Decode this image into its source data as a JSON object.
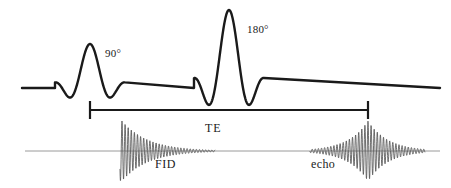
{
  "figure": {
    "kind": "spin-echo-pulse-sequence",
    "background_color": "#ffffff",
    "width": 451,
    "height": 188
  },
  "labels": {
    "pulse_90": "90°",
    "pulse_180": "180°",
    "te": "TE",
    "fid": "FID",
    "echo": "echo"
  },
  "colors": {
    "rf_line": "#1a1a1a",
    "bracket": "#1a1a1a",
    "signal_baseline": "#9a9a9a",
    "signal_trace": "#555555",
    "text": "#1a1a1a"
  },
  "chart_data": {
    "type": "line",
    "title": "",
    "xlabel": "",
    "ylabel": "",
    "grid": false,
    "legend": "none",
    "axes": [
      {
        "name": "rf-channel",
        "baseline_y": 88,
        "x_start": 22,
        "x_end": 440,
        "stroke_width": 2.4
      },
      {
        "name": "signal-channel",
        "baseline_y": 151,
        "x_start": 25,
        "x_end": 440,
        "stroke_width": 1.0
      }
    ],
    "pulses": [
      {
        "name": "rf-pulse-90",
        "label": "90°",
        "flip_angle_deg": 90,
        "center_x": 90,
        "half_width": 35,
        "peak_amplitude": 44,
        "shape": "sinc",
        "lobes": 2
      },
      {
        "name": "rf-pulse-180",
        "label": "180°",
        "flip_angle_deg": 180,
        "center_x": 229,
        "half_width": 35,
        "peak_amplitude": 78,
        "shape": "sinc",
        "lobes": 2
      }
    ],
    "signals": [
      {
        "name": "fid",
        "label": "FID",
        "start_x": 120,
        "end_x": 215,
        "peak_x": 122,
        "peak_amplitude": 30,
        "envelope": "exponential-decay",
        "decay_constant": 26,
        "oscillation_period": 3.1
      },
      {
        "name": "echo",
        "label": "echo",
        "start_x": 310,
        "end_x": 425,
        "peak_x": 368,
        "peak_amplitude": 30,
        "envelope": "symmetric-rise-decay",
        "decay_constant": 20,
        "oscillation_period": 3.1
      }
    ],
    "interval": {
      "name": "TE",
      "label": "TE",
      "x_start": 90,
      "x_end": 368,
      "y": 110,
      "cap_height": 18,
      "description": "echo time from 90 degree pulse to echo peak"
    }
  }
}
